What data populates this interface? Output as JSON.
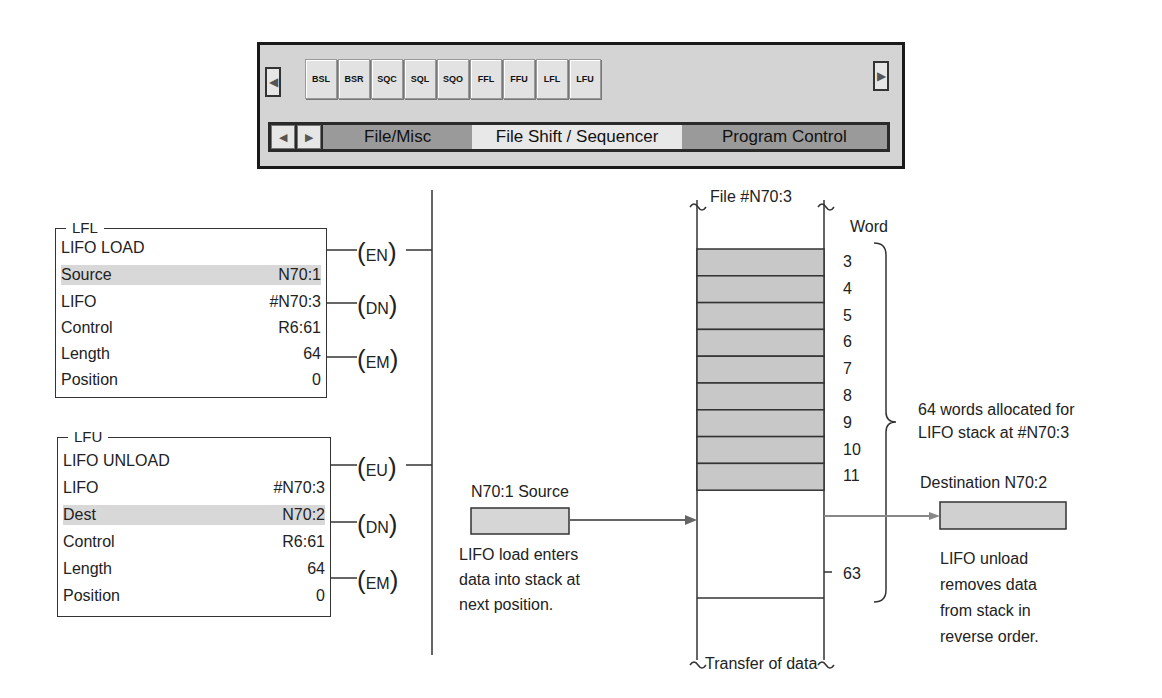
{
  "toolbar": {
    "instructions": [
      "BSL",
      "BSR",
      "SQC",
      "SQL",
      "SQO",
      "FFL",
      "FFU",
      "LFL",
      "LFU"
    ],
    "scroll_left_icon": "◀",
    "scroll_right_icon": "▶",
    "tabs": [
      {
        "label": "File/Misc",
        "active": false
      },
      {
        "label": "File Shift / Sequencer",
        "active": true
      },
      {
        "label": "Program Control",
        "active": false
      }
    ]
  },
  "lfl_block": {
    "mnemonic": "LFL",
    "title": "LIFO LOAD",
    "rows": [
      {
        "label": "Source",
        "value": "N70:1",
        "highlight": true
      },
      {
        "label": "LIFO",
        "value": "#N70:3"
      },
      {
        "label": "Control",
        "value": "R6:61"
      },
      {
        "label": "Length",
        "value": "64"
      },
      {
        "label": "Position",
        "value": "0"
      }
    ],
    "coils": [
      "EN",
      "DN",
      "EM"
    ]
  },
  "lfu_block": {
    "mnemonic": "LFU",
    "title": "LIFO UNLOAD",
    "rows": [
      {
        "label": "LIFO",
        "value": "#N70:3"
      },
      {
        "label": "Dest",
        "value": "N70:2",
        "highlight": true
      },
      {
        "label": "Control",
        "value": "R6:61"
      },
      {
        "label": "Length",
        "value": "64"
      },
      {
        "label": "Position",
        "value": "0"
      }
    ],
    "coils": [
      "EU",
      "DN",
      "EM"
    ]
  },
  "stack": {
    "file_label": "File #N70:3",
    "word_label": "Word",
    "filled_words": [
      "3",
      "4",
      "5",
      "6",
      "7",
      "8",
      "9",
      "10",
      "11"
    ],
    "last_word": "63",
    "allocation_note": [
      "64 words allocated for",
      "LIFO stack at #N70:3"
    ],
    "caption": "Transfer of data"
  },
  "source": {
    "label": "N70:1 Source",
    "note": [
      "LIFO load enters",
      "data into stack at",
      "next position."
    ]
  },
  "destination": {
    "label": "Destination N70:2",
    "note": [
      "LIFO unload",
      "removes data",
      "from stack in",
      "reverse order."
    ]
  },
  "colors": {
    "fill_gray": "#c8c8c8",
    "highlight": "#d8d8d8",
    "arrow": "#777777"
  }
}
